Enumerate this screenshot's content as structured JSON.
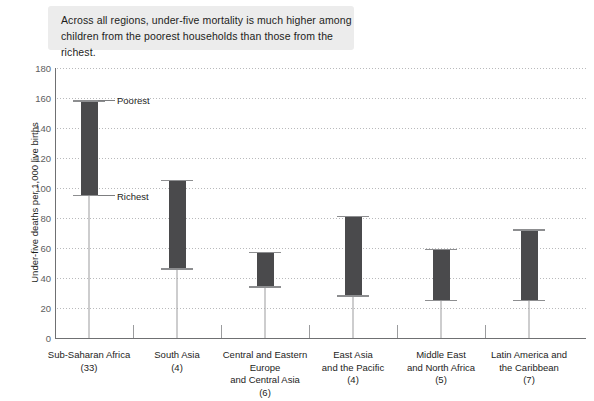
{
  "caption": {
    "text": "Across all regions, under-five mortality is much higher among children from the poorest households than those from the richest."
  },
  "annotations": {
    "poorest_label": "Poorest",
    "richest_label": "Richest"
  },
  "colors": {
    "bar": "#4a4a4c",
    "whisker": "#8d8e90",
    "grid": "#b9babc",
    "axis": "#6f7072",
    "caption_bg": "#ececec",
    "text": "#1d1d1b"
  },
  "chart_data": {
    "type": "bar",
    "title": "",
    "xlabel": "",
    "ylabel": "Under-five deaths per 1,000 live births",
    "ylim": [
      0,
      180
    ],
    "yticks": [
      0,
      20,
      40,
      60,
      80,
      100,
      120,
      140,
      160,
      180
    ],
    "grid": true,
    "legend": "none",
    "categories": [
      "Sub-Saharan Africa\n(33)",
      "South Asia\n(4)",
      "Central and Eastern Europe\nand Central Asia\n(6)",
      "East Asia\nand the Pacific\n(4)",
      "Middle East\nand North Africa\n(5)",
      "Latin America and\nthe Caribbean\n(7)"
    ],
    "category_names": [
      "Sub-Saharan Africa",
      "South Asia",
      "Central and Eastern Europe and Central Asia",
      "East Asia and the Pacific",
      "Middle East and North Africa",
      "Latin America and the Caribbean"
    ],
    "country_counts": [
      33,
      4,
      6,
      4,
      5,
      7
    ],
    "series": [
      {
        "name": "Poorest",
        "values": [
          158,
          105,
          57,
          81,
          59,
          72
        ]
      },
      {
        "name": "Richest",
        "values": [
          95,
          46,
          34,
          28,
          25,
          25
        ]
      }
    ]
  }
}
